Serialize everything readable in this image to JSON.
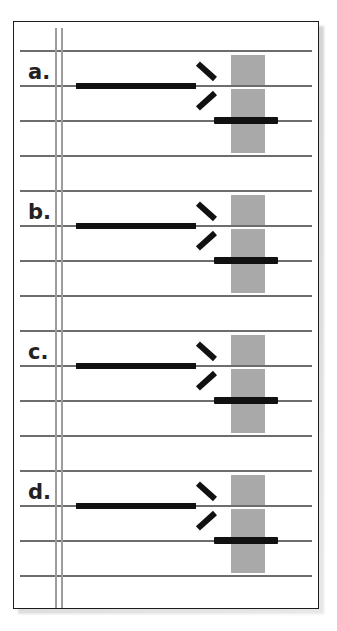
{
  "figure": {
    "kind": "music-notation-exercise",
    "border_color": "#1c1c1c",
    "staff_line_color": "#6d6d6d",
    "barline_color": "#9d9d9d",
    "mark_color": "#111111",
    "block_color": "#a9a9a9",
    "background_color": "#ffffff",
    "shadow_color": "#c9c9c9",
    "systems": [
      {
        "label": "a.",
        "staff_line_count": 4,
        "arrow": {
          "direction": "right",
          "on_line": 2,
          "start_x": 75,
          "end_x": 192
        },
        "black_bar": {
          "on_line": 3,
          "start_x": 213,
          "end_x": 276
        },
        "gray_blocks": {
          "x": 230,
          "count": 3
        }
      },
      {
        "label": "b.",
        "staff_line_count": 4,
        "arrow": {
          "direction": "right",
          "on_line": 2,
          "start_x": 75,
          "end_x": 192
        },
        "black_bar": {
          "on_line": 3,
          "start_x": 213,
          "end_x": 276
        },
        "gray_blocks": {
          "x": 230,
          "count": 3
        }
      },
      {
        "label": "c.",
        "staff_line_count": 4,
        "arrow": {
          "direction": "right",
          "on_line": 2,
          "start_x": 75,
          "end_x": 192
        },
        "black_bar": {
          "on_line": 3,
          "start_x": 213,
          "end_x": 276
        },
        "gray_blocks": {
          "x": 230,
          "count": 3
        }
      },
      {
        "label": "d.",
        "staff_line_count": 4,
        "arrow": {
          "direction": "right",
          "on_line": 2,
          "start_x": 75,
          "end_x": 192
        },
        "black_bar": {
          "on_line": 3,
          "start_x": 213,
          "end_x": 276
        },
        "gray_blocks": {
          "x": 230,
          "count": 3
        }
      }
    ]
  }
}
